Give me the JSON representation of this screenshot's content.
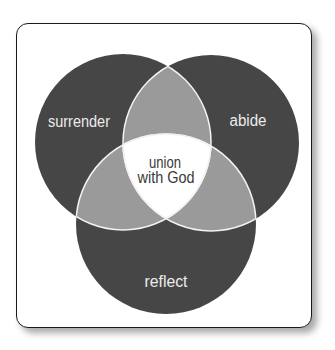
{
  "diagram": {
    "type": "venn",
    "circles": [
      {
        "id": "surrender",
        "label": "surrender",
        "cx": 123,
        "cy": 142,
        "r": 88
      },
      {
        "id": "abide",
        "label": "abide",
        "cx": 211,
        "cy": 143,
        "r": 88
      },
      {
        "id": "reflect",
        "label": "reflect",
        "cx": 166,
        "cy": 224,
        "r": 90
      }
    ],
    "center_label_line1": "union",
    "center_label_line2": "with God",
    "colors": {
      "circle_fill": "#464646",
      "pair_overlap_fill": "#9a9a9a",
      "center_fill": "#ffffff",
      "stroke": "#f2f2f2",
      "outer_label": "#ececec",
      "center_label": "#3a3a3a"
    }
  }
}
